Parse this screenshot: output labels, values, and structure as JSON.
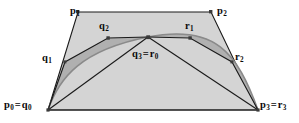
{
  "figure": {
    "kind": "bezier-de-casteljau-subdivision-diagram",
    "background_color": "#ffffff",
    "width": 299,
    "height": 123,
    "stroke_color": "#1a1a1a",
    "outer_polygon_fill": "#d4d4d4",
    "sub_polygon_fill": "#b0b0b0",
    "curve_color": "#8a8a8a",
    "vertex_dot_color": "#3a3a3a"
  },
  "labels": {
    "p1": {
      "text": "p",
      "sub": "1",
      "x": 70,
      "y": 6
    },
    "p2": {
      "text": "p",
      "sub": "2",
      "x": 217,
      "y": 6
    },
    "q2": {
      "text": "q",
      "sub": "2",
      "x": 99,
      "y": 21
    },
    "r1": {
      "text": "r",
      "sub": "1",
      "x": 185,
      "y": 21
    },
    "q1": {
      "text": "q",
      "sub": "1",
      "x": 42,
      "y": 53
    },
    "r2": {
      "text": "r",
      "sub": "2",
      "x": 235,
      "y": 52
    },
    "q3r0": {
      "first": "q",
      "first_sub": "3",
      "equals": "=",
      "second": "r",
      "second_sub": "0",
      "x": 132,
      "y": 49
    },
    "p0q0": {
      "first": "p",
      "first_sub": "0",
      "equals": "=",
      "second": "q",
      "second_sub": "0",
      "x": 4,
      "y": 100
    },
    "p3r3": {
      "first": "p",
      "first_sub": "3",
      "equals": "=",
      "second": "r",
      "second_sub": "3",
      "x": 260,
      "y": 100
    }
  },
  "geometry": {
    "outer_control_polygon": {
      "name": "p-polygon",
      "points": "48,110 78,12 211,12 258,110",
      "vertices": [
        {
          "id": "p0",
          "x": 48,
          "y": 110
        },
        {
          "id": "p1",
          "x": 78,
          "y": 12
        },
        {
          "id": "p2",
          "x": 211,
          "y": 12
        },
        {
          "id": "p3",
          "x": 258,
          "y": 110
        }
      ]
    },
    "left_sub_polygon": {
      "name": "q-polygon",
      "points": "48,110 65,62 108,38 148,37",
      "vertices": [
        {
          "id": "q0",
          "x": 48,
          "y": 110
        },
        {
          "id": "q1",
          "x": 65,
          "y": 62
        },
        {
          "id": "q2",
          "x": 108,
          "y": 38
        },
        {
          "id": "q3",
          "x": 148,
          "y": 37
        }
      ]
    },
    "right_sub_polygon": {
      "name": "r-polygon",
      "points": "148,37 190,38 232,62 258,110",
      "vertices": [
        {
          "id": "r0",
          "x": 148,
          "y": 37
        },
        {
          "id": "r1",
          "x": 190,
          "y": 38
        },
        {
          "id": "r2",
          "x": 232,
          "y": 62
        },
        {
          "id": "r3",
          "x": 258,
          "y": 110
        }
      ]
    },
    "bezier_curve": {
      "name": "cubic-bezier-curve",
      "path": "M 48 110 C 78 12 211 12 258 110",
      "left_half_path": "M 48 110 C 59 78 81 50 148 37",
      "right_half_path": "M 148 37 C 215 24 237 52 258 110"
    }
  }
}
